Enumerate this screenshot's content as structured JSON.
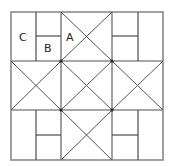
{
  "diagram": {
    "type": "quilt-block-grid",
    "grid": {
      "rows": 3,
      "cols": 3
    },
    "colors": {
      "frame": "#8a8a8a",
      "lines": "#4a4a4a",
      "text": "#222222",
      "background": "#ffffff"
    },
    "labels": [
      {
        "id": "C",
        "text": "C",
        "x": 23,
        "y": 41
      },
      {
        "id": "B",
        "text": "B",
        "x": 48,
        "y": 51
      },
      {
        "id": "A",
        "text": "A",
        "x": 70,
        "y": 41
      }
    ],
    "cells": [
      {
        "row": 0,
        "col": 0,
        "pattern": "rail-split"
      },
      {
        "row": 0,
        "col": 1,
        "pattern": "hourglass-x"
      },
      {
        "row": 0,
        "col": 2,
        "pattern": "rail-split"
      },
      {
        "row": 1,
        "col": 0,
        "pattern": "hourglass-x"
      },
      {
        "row": 1,
        "col": 1,
        "pattern": "hourglass-x"
      },
      {
        "row": 1,
        "col": 2,
        "pattern": "hourglass-x"
      },
      {
        "row": 2,
        "col": 0,
        "pattern": "rail-split"
      },
      {
        "row": 2,
        "col": 1,
        "pattern": "hourglass-x"
      },
      {
        "row": 2,
        "col": 2,
        "pattern": "rail-split"
      }
    ]
  }
}
